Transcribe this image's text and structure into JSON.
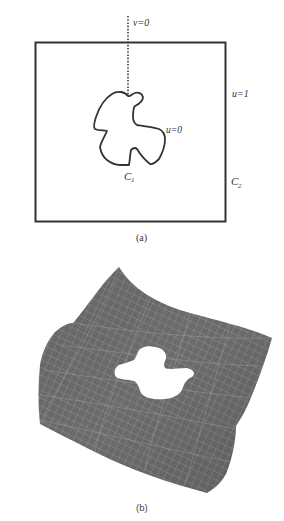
{
  "figure_a": {
    "caption": "(a)",
    "labels": {
      "v0": "v=0",
      "u1": "u=1",
      "u0": "u=0",
      "c1_base": "C",
      "c1_sub": "1",
      "c2_base": "C",
      "c2_sub": "2"
    },
    "colors": {
      "stroke": "#333333",
      "dotted": "#444444"
    }
  },
  "figure_b": {
    "caption": "(b)",
    "description": "3D wireframe surface with hole",
    "colors": {
      "surface": "#6b6b6b",
      "grid": "#a8a8a8",
      "hole": "#ffffff"
    }
  }
}
